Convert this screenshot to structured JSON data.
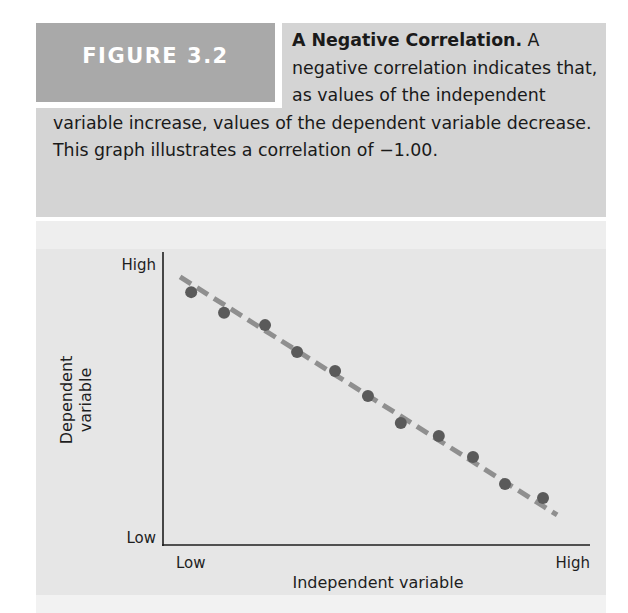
{
  "figure": {
    "label": "FIGURE 3.2",
    "caption_title": "A Negative Correlation.",
    "caption_body": " A negative correlation indicates that, as values of the independent variable increase, values of the dependent variable decrease. This graph illustrates a correlation of −1.00."
  },
  "colors": {
    "label_box": "#a9a9a9",
    "caption_panel": "#d4d4d4",
    "chart_panel": "#e6e6e6",
    "points": "#5a5a5a",
    "trend_line": "#8f8f8f",
    "axes": "#1e1e1e"
  },
  "chart_data": {
    "type": "scatter",
    "title": "A Negative Correlation",
    "xlabel": "Independent variable",
    "ylabel": "Dependent variable",
    "x_ticks": [
      "Low",
      "High"
    ],
    "y_ticks": [
      "Low",
      "High"
    ],
    "xlim": [
      0,
      100
    ],
    "ylim": [
      0,
      100
    ],
    "grid": false,
    "legend": null,
    "correlation": -1.0,
    "points": [
      {
        "x": 6.6,
        "y": 86.6
      },
      {
        "x": 14.3,
        "y": 79.5
      },
      {
        "x": 23.9,
        "y": 75.3
      },
      {
        "x": 31.4,
        "y": 66.1
      },
      {
        "x": 40.3,
        "y": 59.6
      },
      {
        "x": 48.0,
        "y": 51.0
      },
      {
        "x": 55.7,
        "y": 41.8
      },
      {
        "x": 64.6,
        "y": 37.3
      },
      {
        "x": 72.6,
        "y": 30.1
      },
      {
        "x": 80.1,
        "y": 20.9
      },
      {
        "x": 89.0,
        "y": 16.1
      }
    ],
    "trend_line": {
      "style": "dashed",
      "x": [
        4.0,
        92.3
      ],
      "y": [
        91.8,
        10.3
      ]
    }
  }
}
